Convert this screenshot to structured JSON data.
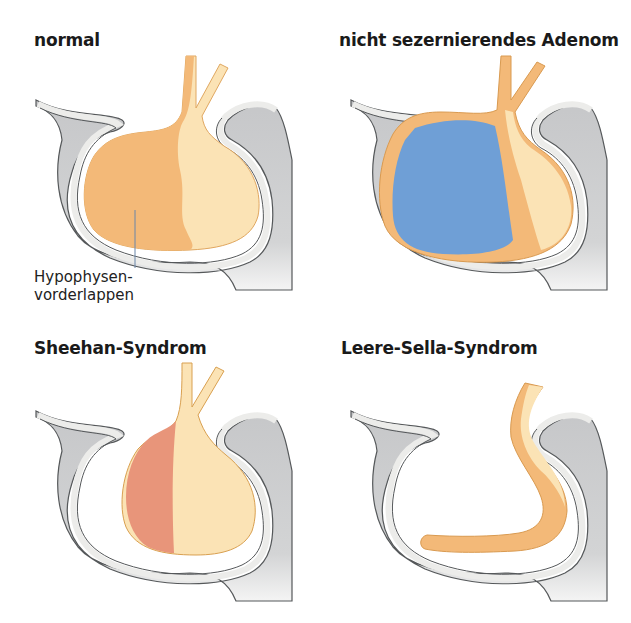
{
  "figure": {
    "panels": [
      {
        "id": "normal",
        "title": "normal"
      },
      {
        "id": "adenoma",
        "title": "nicht sezernierendes Adenom"
      },
      {
        "id": "sheehan",
        "title": "Sheehan-Syndrom"
      },
      {
        "id": "empty-sella",
        "title": "Leere-Sella-Syndrom"
      }
    ],
    "annotation": {
      "line1": "Hypophysen-",
      "line2": "vorderlappen"
    },
    "colors": {
      "bone": "#c9cacb",
      "bone_rim": "#ececea",
      "outline": "#55585a",
      "anterior_lobe": "#f3b978",
      "posterior_lobe": "#fbe3b5",
      "adenoma": "#6f9fd6",
      "necrosis": "#e8957a"
    }
  }
}
